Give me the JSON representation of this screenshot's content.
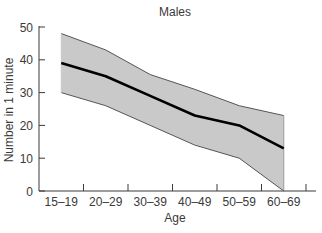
{
  "chart_data": {
    "type": "area",
    "title": "Males",
    "xlabel": "Age",
    "ylabel": "Number in 1 minute",
    "categories": [
      "15–19",
      "20–29",
      "30–39",
      "40–49",
      "50–59",
      "60–69"
    ],
    "series": [
      {
        "name": "Mean",
        "style": "line",
        "values": [
          39,
          35,
          29,
          23,
          20,
          13
        ]
      },
      {
        "name": "Upper bound",
        "style": "band-upper",
        "values": [
          48,
          43,
          35.5,
          31,
          26,
          23
        ]
      },
      {
        "name": "Lower bound",
        "style": "band-lower",
        "values": [
          30,
          26,
          20,
          14,
          10,
          0
        ]
      }
    ],
    "ylim": [
      0,
      50
    ],
    "yticks": [
      0,
      10,
      20,
      30,
      40,
      50
    ],
    "grid": false,
    "legend": "none",
    "colors": {
      "band_fill": "#c9c9c9",
      "band_edge": "#555555",
      "mean_line": "#000000",
      "axis": "#3a3a3a"
    }
  }
}
